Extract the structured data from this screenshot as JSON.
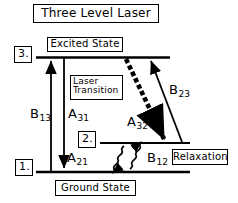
{
  "diagram": {
    "title": "Three Level Laser",
    "levels": [
      {
        "id": "level-3",
        "number": "3.",
        "name": "Excited State"
      },
      {
        "id": "level-2",
        "number": "2.",
        "name": ""
      },
      {
        "id": "level-1",
        "number": "1.",
        "name": "Ground State"
      }
    ],
    "annotations": {
      "laser_transition": "Laser\nTransition",
      "laser_transition_line1": "Laser",
      "laser_transition_line2": "Transition",
      "relaxation": "Relaxation"
    },
    "transitions": [
      {
        "id": "B13",
        "base": "B",
        "sub": "13",
        "from": "1",
        "to": "3",
        "style": "straight-arrow-up"
      },
      {
        "id": "A31",
        "base": "A",
        "sub": "31",
        "from": "3",
        "to": "1",
        "style": "straight-arrow-down"
      },
      {
        "id": "B23",
        "base": "B",
        "sub": "23",
        "from": "2",
        "to": "3",
        "style": "straight-arrow-up"
      },
      {
        "id": "A32",
        "base": "A",
        "sub": "32",
        "from": "3",
        "to": "2",
        "style": "beaded-arrow-down"
      },
      {
        "id": "A21",
        "base": "A",
        "sub": "21",
        "from": "2",
        "to": "1",
        "style": "wavy-arrow-down"
      },
      {
        "id": "B12",
        "base": "B",
        "sub": "12",
        "from": "1",
        "to": "2",
        "style": "wavy-arrow-up"
      }
    ],
    "colors": {
      "ink": "#000000",
      "background": "#ffffff"
    }
  }
}
